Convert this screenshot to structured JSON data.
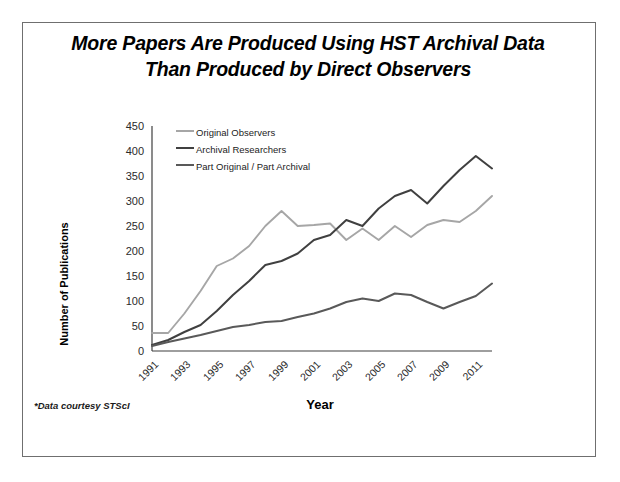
{
  "slide": {
    "title_line1": "More Papers Are Produced Using HST Archival Data",
    "title_line2": "Than Produced by Direct Observers",
    "footnote": "*Data courtesy STScI"
  },
  "colors": {
    "series_original_observers": "#a6a6a6",
    "series_archival_researchers": "#404040",
    "series_part_original_part_archival": "#595959",
    "axis": "#3f3f3f",
    "frame": "#6f6f6f",
    "text": "#000000"
  },
  "chart_data": {
    "type": "line",
    "title": "More Papers Are Produced Using HST Archival Data Than Produced by Direct Observers",
    "subtitle": "",
    "xlabel": "Year",
    "ylabel": "Number of Publications",
    "grid": false,
    "legend_position": "top-left-inside",
    "xlim": [
      1991,
      2012
    ],
    "ylim": [
      0,
      450
    ],
    "yticks": [
      0,
      50,
      100,
      150,
      200,
      250,
      300,
      350,
      400,
      450
    ],
    "xticks": [
      1991,
      1993,
      1995,
      1997,
      1999,
      2001,
      2003,
      2005,
      2007,
      2009,
      2011
    ],
    "xtick_labels": [
      "1991",
      "1993",
      "1995",
      "1997",
      "1999",
      "2001",
      "2003",
      "2005",
      "2007",
      "2009",
      "2011"
    ],
    "ytick_labels": [
      "0",
      "50",
      "100",
      "150",
      "200",
      "250",
      "300",
      "350",
      "400",
      "450"
    ],
    "x": [
      1991,
      1992,
      1993,
      1994,
      1995,
      1996,
      1997,
      1998,
      1999,
      2000,
      2001,
      2002,
      2003,
      2004,
      2005,
      2006,
      2007,
      2008,
      2009,
      2010,
      2011,
      2012
    ],
    "series": [
      {
        "name": "Original Observers",
        "color": "#a6a6a6",
        "values": [
          36,
          36,
          75,
          120,
          170,
          185,
          210,
          250,
          280,
          250,
          252,
          255,
          222,
          245,
          222,
          250,
          228,
          252,
          262,
          258,
          280,
          310
        ]
      },
      {
        "name": "Archival Researchers",
        "color": "#404040",
        "values": [
          12,
          22,
          38,
          52,
          80,
          112,
          140,
          172,
          180,
          195,
          222,
          232,
          262,
          250,
          285,
          310,
          322,
          295,
          330,
          362,
          390,
          365
        ]
      },
      {
        "name": "Part Original / Part Archival",
        "color": "#595959",
        "values": [
          10,
          18,
          25,
          32,
          40,
          48,
          52,
          58,
          60,
          68,
          75,
          85,
          98,
          105,
          100,
          115,
          112,
          98,
          85,
          98,
          110,
          135
        ]
      }
    ],
    "legend": [
      "Original Observers",
      "Archival Researchers",
      "Part Original / Part Archival"
    ],
    "annotations": [
      "*Data courtesy STScI"
    ]
  }
}
